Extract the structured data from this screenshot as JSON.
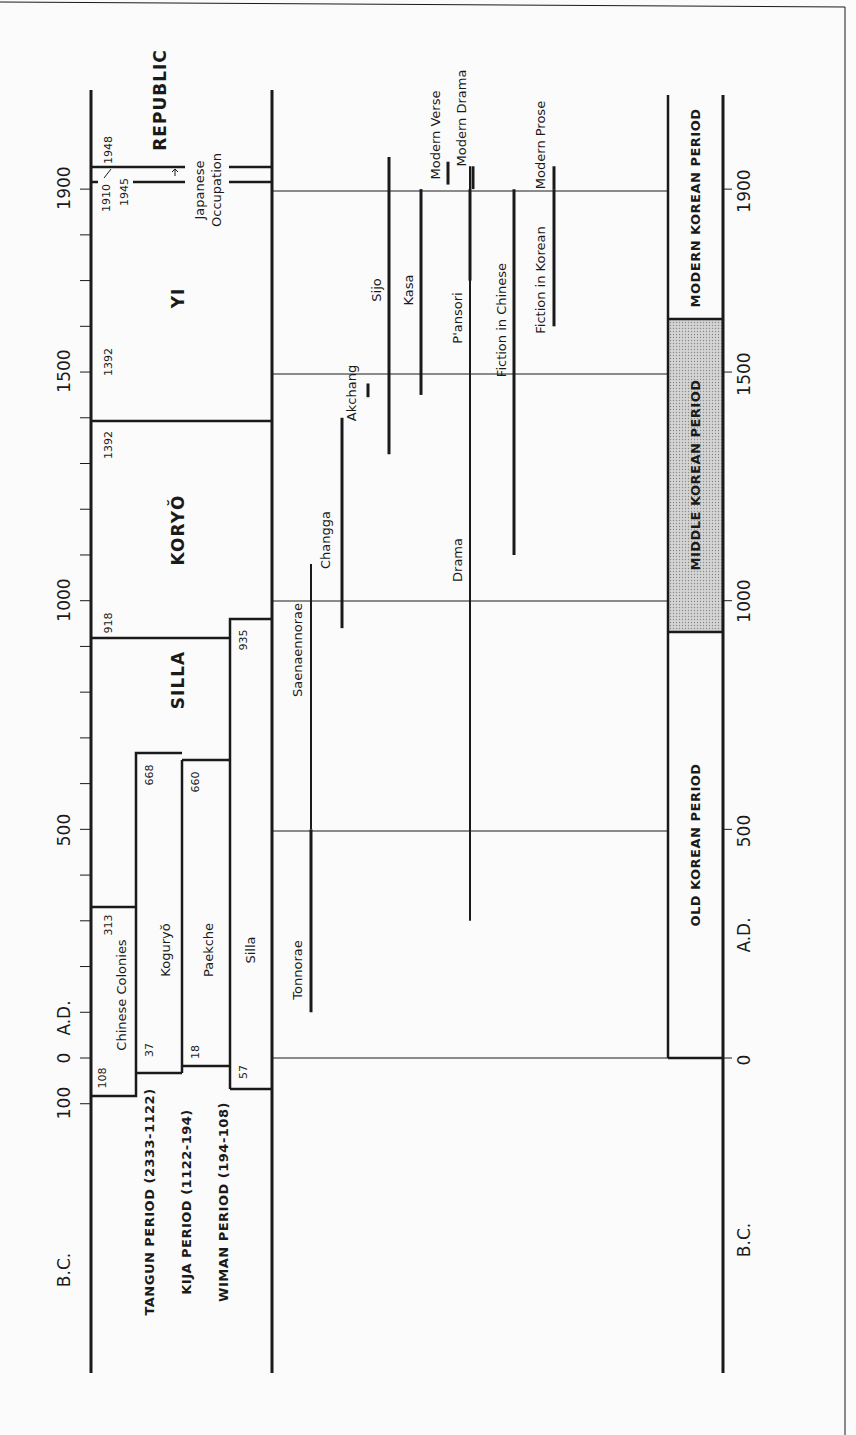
{
  "figure": {
    "orientation": "rotated-90-ccw",
    "scale": {
      "year0_y": 1058,
      "px_per_year": 0.4573
    },
    "left_axis": {
      "ticks": [
        {
          "label": "100",
          "year": -100
        },
        {
          "label": "0",
          "year": 0
        },
        {
          "label": "500",
          "year": 500
        },
        {
          "label": "1000",
          "year": 1000
        },
        {
          "label": "1500",
          "year": 1500
        },
        {
          "label": "1900",
          "year": 1900
        }
      ],
      "era_labels": {
        "bc": "B.C.",
        "ad": "A.D."
      }
    },
    "right_axis": {
      "ticks": [
        {
          "label": "0",
          "year": 0
        },
        {
          "label": "500",
          "year": 500
        },
        {
          "label": "1000",
          "year": 1000
        },
        {
          "label": "1500",
          "year": 1500
        },
        {
          "label": "1900",
          "year": 1900
        }
      ],
      "era_labels": {
        "bc": "B.C.",
        "ad": "A.D."
      }
    },
    "dynasties": {
      "republic": {
        "label": "REPUBLIC",
        "start": "1948"
      },
      "japanese_occupation": {
        "label_line1": "Japanese",
        "label_line2": "Occupation",
        "start": "1910",
        "end": "1945"
      },
      "yi": {
        "label": "YI",
        "start": "1392"
      },
      "koryo": {
        "label": "KORYŎ",
        "start": "918",
        "end": "1392"
      },
      "silla_unified": {
        "label": "SILLA",
        "end": "935"
      },
      "chinese_colonies": {
        "label": "Chinese Colonies",
        "start": "108",
        "end": "313"
      },
      "koguryo": {
        "label": "Koguryŏ",
        "start": "37",
        "end": "668"
      },
      "paekche": {
        "label": "Paekche",
        "start": "18",
        "end": "660"
      },
      "silla": {
        "label": "Silla",
        "start": "57",
        "end": "935"
      },
      "early_periods": [
        "TANGUN PERIOD (2333-1122)",
        "KIJA PERIOD (1122-194)",
        "WIMAN PERIOD (194-108)"
      ]
    },
    "literature": [
      {
        "label": "Tonnorae",
        "start": 100,
        "end": 500
      },
      {
        "label": "Saenaennorae",
        "start": 500,
        "end": 1080
      },
      {
        "label": "Changga",
        "start": 940,
        "end": 1400
      },
      {
        "label": "Akchang",
        "start": 1445,
        "end": 1475
      },
      {
        "label": "Sijo",
        "start": 1320,
        "end": 1970
      },
      {
        "label": "Kasa",
        "start": 1450,
        "end": 1900
      },
      {
        "label": "Modern Verse",
        "start": 1910,
        "end": 1960
      },
      {
        "label": "Drama",
        "start": 300,
        "end": 1950
      },
      {
        "label": "P'ansori",
        "start": 1700,
        "end": 1900
      },
      {
        "label": "Modern Drama",
        "start": 1900,
        "end": 1950
      },
      {
        "label": "Fiction in Chinese",
        "start": 1100,
        "end": 1900
      },
      {
        "label": "Fiction in Korean",
        "start": 1600,
        "end": 1900
      },
      {
        "label": "Modern Prose",
        "start": 1900,
        "end": 1950
      }
    ],
    "language_periods": [
      {
        "label": "OLD KOREAN PERIOD",
        "start": 0,
        "end": 935
      },
      {
        "label": "MIDDLE KOREAN PERIOD",
        "start": 935,
        "end": 1600,
        "shaded": true
      },
      {
        "label": "MODERN KOREAN PERIOD",
        "start": 1600,
        "end": 1970
      }
    ]
  }
}
